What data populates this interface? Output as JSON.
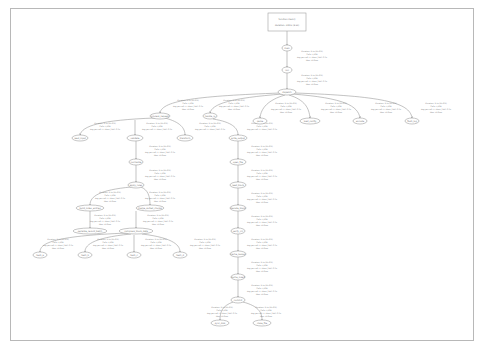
{
  "graph": {
    "title": "Call graph",
    "root": {
      "line1": "function main()",
      "line2": "Duration: 100% (8.2s)"
    },
    "nodes": [
      {
        "id": "n1",
        "label": "main"
      },
      {
        "id": "n2",
        "label": "run"
      },
      {
        "id": "n3",
        "label": "dispatch"
      },
      {
        "id": "c1",
        "label": "process_request"
      },
      {
        "id": "c2",
        "label": "handle_io"
      },
      {
        "id": "c3",
        "label": "parse"
      },
      {
        "id": "c4",
        "label": "load_config"
      },
      {
        "id": "c5",
        "label": "encode"
      },
      {
        "id": "c6",
        "label": "flush_log"
      },
      {
        "id": "d1",
        "label": "read_input"
      },
      {
        "id": "d2",
        "label": "validate"
      },
      {
        "id": "d3",
        "label": "transform"
      },
      {
        "id": "d4",
        "label": "write_output"
      },
      {
        "id": "e1",
        "label": "normalize"
      },
      {
        "id": "e2",
        "label": "apply_rules"
      },
      {
        "id": "f1",
        "label": "build_index_entries"
      },
      {
        "id": "f2",
        "label": "merge_sorted_chunks"
      },
      {
        "id": "g1",
        "label": "serialize_record_batch"
      },
      {
        "id": "g2",
        "label": "compress_block_data"
      },
      {
        "id": "h1",
        "label": "hash_a"
      },
      {
        "id": "h2",
        "label": "hash_b"
      },
      {
        "id": "h3",
        "label": "hash_c"
      },
      {
        "id": "h4",
        "label": "hash_d"
      },
      {
        "id": "r1",
        "label": "open_file"
      },
      {
        "id": "r2",
        "label": "read_block"
      },
      {
        "id": "r3",
        "label": "decode_block"
      },
      {
        "id": "r4",
        "label": "verify_crc"
      },
      {
        "id": "r5",
        "label": "cache_lookup"
      },
      {
        "id": "r6",
        "label": "cache_insert"
      },
      {
        "id": "r7",
        "label": "commit"
      },
      {
        "id": "r8",
        "label": "sync_disk"
      },
      {
        "id": "r9",
        "label": "close_file"
      }
    ],
    "edge_labels": {
      "line1": "Duration: 2.1s (25.6%)",
      "line2": "Calls: 1,204",
      "line3": "Avg per call: 1.74ms | Self: 0.3s",
      "line4": "Max: 12.6ms"
    }
  }
}
